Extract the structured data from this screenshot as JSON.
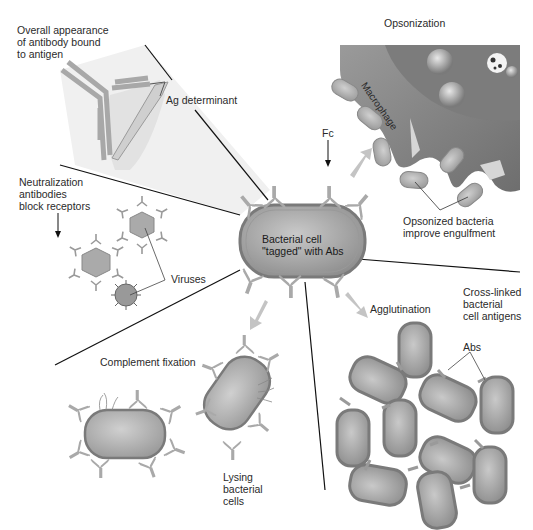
{
  "diagram": {
    "center": {
      "label_line1": "Bacterial cell",
      "label_line2": "\"tagged\" with Abs"
    },
    "sections": {
      "antigen_binding": {
        "title_line1": "Overall appearance",
        "title_line2": "of antibody bound",
        "title_line3": "to antigen",
        "ag_determinant": "Ag determinant"
      },
      "opsonization": {
        "title": "Opsonization",
        "macrophage": "Macrophage",
        "fc": "Fc",
        "caption_line1": "Opsonized bacteria",
        "caption_line2": "improve engulfment"
      },
      "neutralization": {
        "title_line1": "Neutralization",
        "title_line2": "antibodies",
        "title_line3": "block receptors",
        "viruses": "Viruses"
      },
      "complement": {
        "title": "Complement fixation",
        "caption_line1": "Lysing",
        "caption_line2": "bacterial",
        "caption_line3": "cells"
      },
      "agglutination": {
        "title": "Agglutination",
        "cross_line1": "Cross-linked",
        "cross_line2": "bacterial",
        "cross_line3": "cell antigens",
        "abs": "Abs"
      }
    },
    "colors": {
      "cell_fill": "#a8a8a8",
      "cell_stroke": "#7a7a7a",
      "antibody": "#bdbdbd",
      "macrophage": "#8c8c8c",
      "shaded_panel": "#efefef",
      "line": "#111111"
    }
  }
}
